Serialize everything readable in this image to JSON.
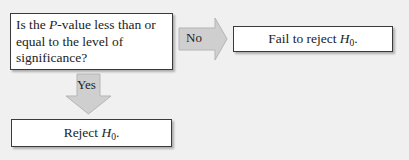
{
  "diagram": {
    "question": {
      "prefix": "Is the ",
      "variable": "P",
      "suffix_line1": "-value less than or",
      "line2": "equal to the level of",
      "line3": "significance?"
    },
    "no_branch": {
      "label": "No",
      "result_text": "Fail to reject ",
      "result_variable": "H",
      "result_subscript": "0",
      "result_end": "."
    },
    "yes_branch": {
      "label": "Yes",
      "result_text": "Reject ",
      "result_variable": "H",
      "result_subscript": "0",
      "result_end": "."
    },
    "colors": {
      "background": "#f0f0f0",
      "box_fill": "#ffffff",
      "box_border": "#3a3a3a",
      "arrow_fill": "#cfcfcf",
      "arrow_edge": "#b5b5b5"
    }
  }
}
